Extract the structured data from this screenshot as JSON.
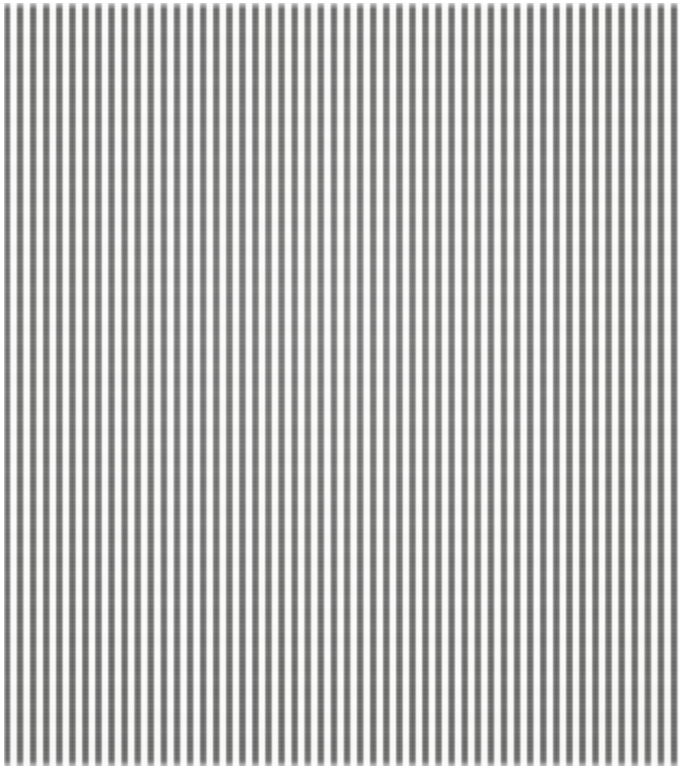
{
  "image": {
    "kind": "textile-swatch-photograph",
    "subject": "vertically striped woven cotton fabric",
    "pattern_name": "ticking stripe",
    "orientation": "vertical",
    "width_px": 689,
    "height_px": 770,
    "alt_text": "Close-up photograph of white cotton fabric printed or woven with evenly spaced narrow dark gray vertical stripes."
  },
  "palette": {
    "stripe_color": "#747474",
    "stripe_core_shadow": "#5a5a5a",
    "stripe_edge_soft": "#9a9a9a",
    "ground_color": "#fbfbfa",
    "margin_color": "#ffffff"
  },
  "stripe_geometry": {
    "period_px": 13.08,
    "stripe_width_px": 6.0,
    "gap_width_px": 7.1,
    "stripe_count": 53,
    "first_stripe_left_px": 4,
    "last_stripe_right_px": 678,
    "edge_softness_px": 1.2
  },
  "margins": {
    "top_px": 3,
    "bottom_px": 4,
    "left_px": 4,
    "right_px": 10
  },
  "texture": {
    "weave_direction": "horizontal weft over vertical warp",
    "weft_band_px": 4,
    "slub_band_px": 26,
    "surface_finish": "matte woven cotton"
  }
}
